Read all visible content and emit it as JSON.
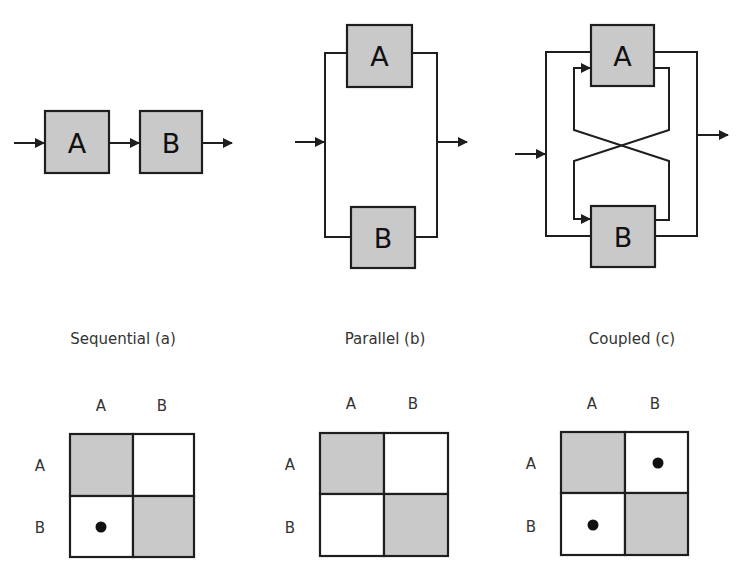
{
  "figure": {
    "panels": [
      {
        "id": "a",
        "type": "sequential",
        "caption": "Sequential (a)",
        "blocks": [
          {
            "label": "A"
          },
          {
            "label": "B"
          }
        ],
        "matrix": {
          "col_labels": [
            "A",
            "B"
          ],
          "row_labels": [
            "A",
            "B"
          ],
          "cells": [
            [
              {
                "shaded": true,
                "dot": false
              },
              {
                "shaded": false,
                "dot": false
              }
            ],
            [
              {
                "shaded": false,
                "dot": true
              },
              {
                "shaded": true,
                "dot": false
              }
            ]
          ]
        }
      },
      {
        "id": "b",
        "type": "parallel",
        "caption": "Parallel (b)",
        "blocks": [
          {
            "label": "A"
          },
          {
            "label": "B"
          }
        ],
        "matrix": {
          "col_labels": [
            "A",
            "B"
          ],
          "row_labels": [
            "A",
            "B"
          ],
          "cells": [
            [
              {
                "shaded": true,
                "dot": false
              },
              {
                "shaded": false,
                "dot": false
              }
            ],
            [
              {
                "shaded": false,
                "dot": false
              },
              {
                "shaded": true,
                "dot": false
              }
            ]
          ]
        }
      },
      {
        "id": "c",
        "type": "coupled",
        "caption": "Coupled (c)",
        "blocks": [
          {
            "label": "A"
          },
          {
            "label": "B"
          }
        ],
        "matrix": {
          "col_labels": [
            "A",
            "B"
          ],
          "row_labels": [
            "A",
            "B"
          ],
          "cells": [
            [
              {
                "shaded": true,
                "dot": false
              },
              {
                "shaded": false,
                "dot": true
              }
            ],
            [
              {
                "shaded": false,
                "dot": true
              },
              {
                "shaded": true,
                "dot": false
              }
            ]
          ]
        }
      }
    ],
    "colors": {
      "block_fill": "#c9c9c9",
      "line": "#1e1e1e",
      "background": "#ffffff"
    }
  }
}
